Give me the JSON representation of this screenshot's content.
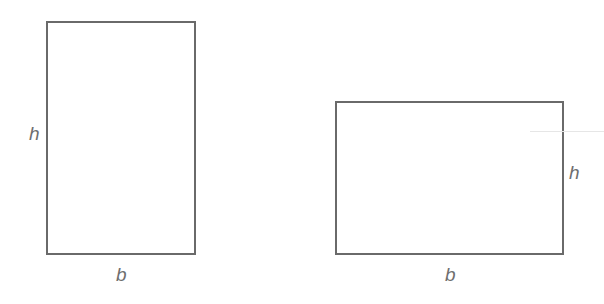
{
  "figures": [
    {
      "name": "tall-rectangle",
      "height_label": "h",
      "base_label": "b"
    },
    {
      "name": "wide-rectangle",
      "height_label": "h",
      "base_label": "b"
    }
  ],
  "colors": {
    "stroke": "#6a6a6a",
    "label": "#6e6e6e"
  }
}
